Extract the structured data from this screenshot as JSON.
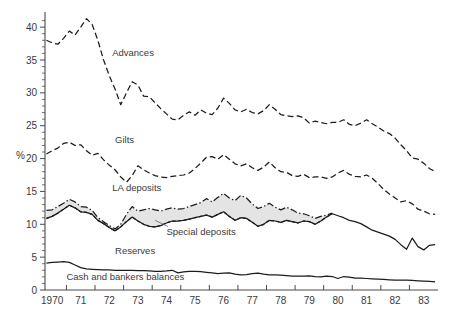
{
  "chart_data": {
    "type": "line",
    "title": "",
    "subtitle": "",
    "xlabel": "",
    "ylabel": "%",
    "xlim": [
      1969.75,
      1983.5
    ],
    "ylim": [
      0,
      42
    ],
    "yticks": [
      0,
      5,
      10,
      15,
      20,
      25,
      30,
      35,
      40
    ],
    "ytick_labels": [
      "0",
      "5",
      "10",
      "15",
      "20",
      "25",
      "30",
      "35",
      "40"
    ],
    "xticks": [
      1970,
      1971,
      1972,
      1973,
      1974,
      1975,
      1976,
      1977,
      1978,
      1979,
      1980,
      1981,
      1982,
      1983
    ],
    "xtick_labels": [
      "1970",
      "71",
      "72",
      "73",
      "74",
      "75",
      "76",
      "77",
      "78",
      "79",
      "80",
      "81",
      "82",
      "83"
    ],
    "grid": false,
    "legend_position": "inline-annotations",
    "x": [
      1969.8,
      1970.0,
      1970.2,
      1970.4,
      1970.6,
      1970.8,
      1971.0,
      1971.2,
      1971.4,
      1971.6,
      1971.8,
      1972.0,
      1972.2,
      1972.4,
      1972.6,
      1972.8,
      1973.0,
      1973.2,
      1973.4,
      1973.6,
      1973.8,
      1974.0,
      1974.2,
      1974.4,
      1974.6,
      1974.8,
      1975.0,
      1975.2,
      1975.4,
      1975.6,
      1975.8,
      1976.0,
      1976.2,
      1976.4,
      1976.6,
      1976.8,
      1977.0,
      1977.2,
      1977.4,
      1977.6,
      1977.8,
      1978.0,
      1978.2,
      1978.4,
      1978.6,
      1978.8,
      1979.0,
      1979.2,
      1979.4,
      1979.6,
      1979.8,
      1980.0,
      1980.2,
      1980.4,
      1980.6,
      1980.8,
      1981.0,
      1981.2,
      1981.4,
      1981.6,
      1981.8,
      1982.0,
      1982.2,
      1982.4,
      1982.6,
      1982.8,
      1983.0,
      1983.2,
      1983.4
    ],
    "series": [
      {
        "name": "Advances",
        "style": "dashed",
        "label_position": {
          "x": 1972.1,
          "y": 35.6
        },
        "values": [
          38.0,
          37.6,
          37.4,
          38.3,
          39.4,
          38.8,
          40.0,
          41.3,
          40.4,
          38.0,
          35.0,
          32.6,
          30.6,
          28.2,
          30.0,
          31.7,
          31.2,
          29.5,
          29.4,
          28.5,
          27.6,
          26.8,
          26.0,
          25.9,
          26.6,
          27.1,
          26.6,
          27.4,
          26.9,
          26.7,
          27.7,
          29.2,
          28.4,
          27.4,
          27.1,
          27.5,
          27.0,
          26.8,
          27.3,
          28.2,
          27.5,
          26.7,
          26.5,
          26.4,
          26.5,
          26.2,
          25.4,
          25.7,
          25.5,
          25.3,
          25.5,
          25.5,
          25.9,
          25.2,
          25.0,
          25.4,
          25.9,
          25.3,
          24.8,
          24.2,
          23.8,
          23.1,
          22.1,
          21.2,
          20.1,
          19.9,
          19.3,
          18.5,
          18.0
        ]
      },
      {
        "name": "Gilts",
        "style": "dashed",
        "label_position": {
          "x": 1972.2,
          "y": 22.4
        },
        "values": [
          20.7,
          21.2,
          21.6,
          22.3,
          22.5,
          22.0,
          22.1,
          21.2,
          20.5,
          20.8,
          19.8,
          19.0,
          18.3,
          17.2,
          16.4,
          17.4,
          18.9,
          18.3,
          17.8,
          17.4,
          17.2,
          17.1,
          17.3,
          17.4,
          17.5,
          17.8,
          18.5,
          19.3,
          20.2,
          20.3,
          19.9,
          20.6,
          19.9,
          19.2,
          18.9,
          19.2,
          18.6,
          18.2,
          18.7,
          19.5,
          18.6,
          18.0,
          17.9,
          17.4,
          17.3,
          17.6,
          17.1,
          17.2,
          17.2,
          17.0,
          17.2,
          17.8,
          18.2,
          17.6,
          17.3,
          17.2,
          17.5,
          17.0,
          16.2,
          15.3,
          14.6,
          14.0,
          13.4,
          13.6,
          13.1,
          12.3,
          12.0,
          11.6,
          11.5
        ]
      },
      {
        "name": "LA deposits",
        "style": "dash-dot",
        "label_position": {
          "x": 1972.1,
          "y": 15.1
        },
        "values": [
          12.1,
          12.2,
          12.7,
          13.2,
          13.8,
          13.4,
          12.7,
          12.6,
          12.1,
          11.0,
          10.4,
          9.8,
          9.3,
          10.0,
          11.5,
          12.7,
          12.0,
          12.2,
          12.4,
          12.2,
          12.0,
          12.3,
          12.5,
          12.3,
          12.4,
          12.7,
          13.0,
          13.3,
          13.9,
          13.4,
          14.1,
          14.7,
          14.0,
          13.6,
          14.4,
          14.0,
          13.1,
          12.4,
          12.7,
          13.2,
          12.6,
          12.2,
          12.6,
          12.2,
          11.7,
          11.6,
          11.3,
          10.9,
          11.2,
          11.4,
          11.7,
          null,
          null,
          null,
          null,
          null,
          null,
          null,
          null,
          null,
          null,
          null,
          null,
          null,
          null,
          null,
          null,
          null,
          null
        ]
      },
      {
        "name": "Special deposits",
        "style": "dotted",
        "label_position": {
          "x": 1974.0,
          "y": 8.3
        },
        "leader_from": {
          "x": 1973.6,
          "y": 10.6
        },
        "values": [
          10.9,
          11.2,
          11.7,
          12.3,
          12.9,
          12.5,
          11.9,
          11.8,
          11.5,
          10.6,
          10.1,
          9.5,
          9.0,
          9.6,
          10.4,
          11.1,
          10.5,
          10.0,
          9.7,
          9.6,
          9.8,
          10.2,
          10.5,
          10.5,
          10.6,
          10.8,
          11.0,
          11.2,
          11.4,
          11.1,
          11.5,
          11.9,
          11.2,
          10.6,
          11.0,
          10.9,
          10.3,
          9.7,
          10.0,
          10.6,
          10.5,
          10.3,
          10.6,
          10.4,
          10.2,
          10.5,
          10.4,
          10.0,
          10.5,
          11.1,
          11.6,
          null,
          null,
          null,
          null,
          null,
          null,
          null,
          null,
          null,
          null,
          null,
          null,
          null,
          null,
          null,
          null,
          null,
          null
        ]
      },
      {
        "name": "Reserves",
        "style": "solid",
        "label_position": {
          "x": 1972.2,
          "y": 5.5
        },
        "values": [
          10.9,
          11.2,
          11.7,
          12.3,
          12.9,
          12.5,
          11.9,
          11.8,
          11.5,
          10.6,
          10.1,
          9.5,
          9.0,
          9.6,
          10.4,
          11.1,
          10.5,
          10.0,
          9.7,
          9.6,
          9.8,
          10.2,
          10.5,
          10.5,
          10.6,
          10.8,
          11.0,
          11.2,
          11.4,
          11.1,
          11.5,
          11.9,
          11.2,
          10.6,
          11.0,
          10.9,
          10.3,
          9.7,
          10.0,
          10.6,
          10.5,
          10.3,
          10.6,
          10.4,
          10.2,
          10.5,
          10.4,
          10.0,
          10.5,
          11.1,
          11.6,
          11.3,
          11.0,
          10.6,
          10.4,
          10.1,
          9.6,
          9.1,
          8.8,
          8.5,
          8.2,
          7.7,
          6.9,
          6.2,
          7.9,
          6.6,
          6.1,
          6.8,
          6.9
        ]
      },
      {
        "name": "Cash and bankers balances",
        "style": "solid",
        "label_position": {
          "x": 1970.5,
          "y": 1.45
        },
        "values": [
          4.1,
          4.2,
          4.25,
          4.3,
          4.2,
          3.8,
          3.4,
          3.2,
          3.15,
          3.1,
          3.05,
          3.05,
          3.0,
          3.0,
          3.0,
          3.0,
          2.95,
          2.95,
          2.9,
          2.85,
          2.85,
          2.9,
          3.0,
          2.6,
          2.75,
          2.85,
          2.85,
          2.8,
          2.7,
          2.6,
          2.5,
          2.55,
          2.6,
          2.4,
          2.3,
          2.35,
          2.5,
          2.55,
          2.4,
          2.3,
          2.3,
          2.25,
          2.2,
          2.1,
          2.1,
          2.1,
          2.15,
          2.05,
          2.0,
          2.1,
          2.05,
          1.75,
          2.05,
          1.95,
          1.8,
          1.8,
          1.75,
          1.7,
          1.65,
          1.6,
          1.55,
          1.5,
          1.5,
          1.5,
          1.45,
          1.4,
          1.35,
          1.3,
          1.25
        ]
      }
    ]
  },
  "axis": {
    "y_title": "%"
  },
  "labels": {
    "advances": "Advances",
    "gilts": "Gilts",
    "la_deposits": "LA deposits",
    "special_deposits": "Special deposits",
    "reserves": "Reserves",
    "cash": "Cash and bankers balances"
  },
  "colors": {
    "ink": "#1c1c1c",
    "axis": "#4a4a4a",
    "text": "#3a3a3a",
    "band_fill": "#e3e3e3",
    "background": "#ffffff"
  }
}
